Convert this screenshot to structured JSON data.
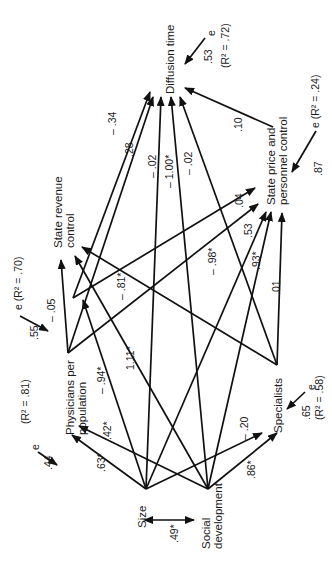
{
  "diagram": {
    "type": "path-diagram",
    "orientation": "rotated-90-ccw",
    "nodes": {
      "size": {
        "label": "Size"
      },
      "social_development": {
        "line1": "Social",
        "line2": "development"
      },
      "physicians": {
        "line1": "Physicians per",
        "line2": "population"
      },
      "specialists": {
        "label": "Specialists"
      },
      "state_revenue": {
        "line1": "State revenue",
        "line2": "control"
      },
      "state_price": {
        "line1": "State price and",
        "line2": "personnel control"
      },
      "diffusion": {
        "label": "Diffusion time"
      }
    },
    "correlation": {
      "from": "Size",
      "to": "Social development",
      "value": ".49*"
    },
    "paths": [
      {
        "from": "Size",
        "to": "Physicians per population",
        "coef": ".63*"
      },
      {
        "from": "Social development",
        "to": "Physicians per population",
        "coef": ".42*"
      },
      {
        "from": "Size",
        "to": "Specialists",
        "coef": "– .20"
      },
      {
        "from": "Social development",
        "to": "Specialists",
        "coef": ".86*"
      },
      {
        "from": "Physicians per population",
        "to": "State revenue control",
        "coef": "– .05"
      },
      {
        "from": "Size",
        "to": "State revenue control",
        "coef": "– .94*"
      },
      {
        "from": "Social development",
        "to": "State revenue control",
        "coef": "1.11*"
      },
      {
        "from": "Specialists",
        "to": "State revenue control",
        "coef": "– .81*"
      },
      {
        "from": "State revenue control",
        "to": "State price and personnel control",
        "coef": ".04"
      },
      {
        "from": "Physicians per population",
        "to": "State price and personnel control",
        "coef": "– .98*"
      },
      {
        "from": "Size",
        "to": "State price and personnel control",
        "coef": ".53"
      },
      {
        "from": "Social development",
        "to": "State price and personnel control",
        "coef": ".93*"
      },
      {
        "from": "Specialists",
        "to": "State price and personnel control",
        "coef": ".01"
      },
      {
        "from": "State revenue control",
        "to": "Diffusion time",
        "coef": "– .34"
      },
      {
        "from": "Physicians per population",
        "to": "Diffusion time",
        "coef": ".28"
      },
      {
        "from": "Size",
        "to": "Diffusion time",
        "coef": "– .02"
      },
      {
        "from": "Social development",
        "to": "Diffusion time",
        "coef": "– 1.00*"
      },
      {
        "from": "Specialists",
        "to": "Diffusion time",
        "coef": "– .02"
      },
      {
        "from": "State price and personnel control",
        "to": "Diffusion time",
        "coef": ".10"
      }
    ],
    "errors": {
      "physicians": {
        "e": "e",
        "coef": ".44",
        "r2": "(R² = .81)"
      },
      "specialists": {
        "e": "e",
        "coef": ".65",
        "r2": "(R² = .58)"
      },
      "state_revenue": {
        "label": "e (R² = .70)",
        "coef": ".55"
      },
      "state_price": {
        "label": "e (R² = .24)",
        "coef": ".87"
      },
      "diffusion": {
        "e": "e",
        "coef": ".53",
        "r2": "(R² = .72)"
      }
    }
  }
}
